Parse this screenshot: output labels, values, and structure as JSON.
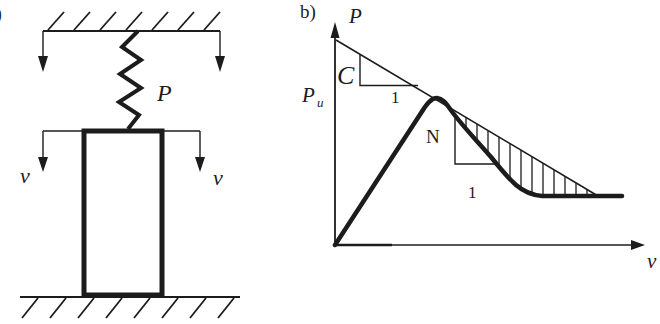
{
  "figure": {
    "description_labels": {
      "panel_a": "a)",
      "panel_b": "b)"
    }
  },
  "panel_a": {
    "label": "a)",
    "spring_load_label": "P",
    "left_displacement_label": "v",
    "right_displacement_label": "v"
  },
  "panel_b": {
    "label": "b)",
    "y_axis_label": "P",
    "x_axis_label": "v",
    "peak_load_label": "P",
    "peak_load_subscript": "u",
    "machine_stiffness_label": "C",
    "machine_stiffness_run": "1",
    "softening_slope_label": "N",
    "softening_slope_run": "1"
  },
  "colors": {
    "ink": "#1c1c1c",
    "background": "#ffffff"
  }
}
